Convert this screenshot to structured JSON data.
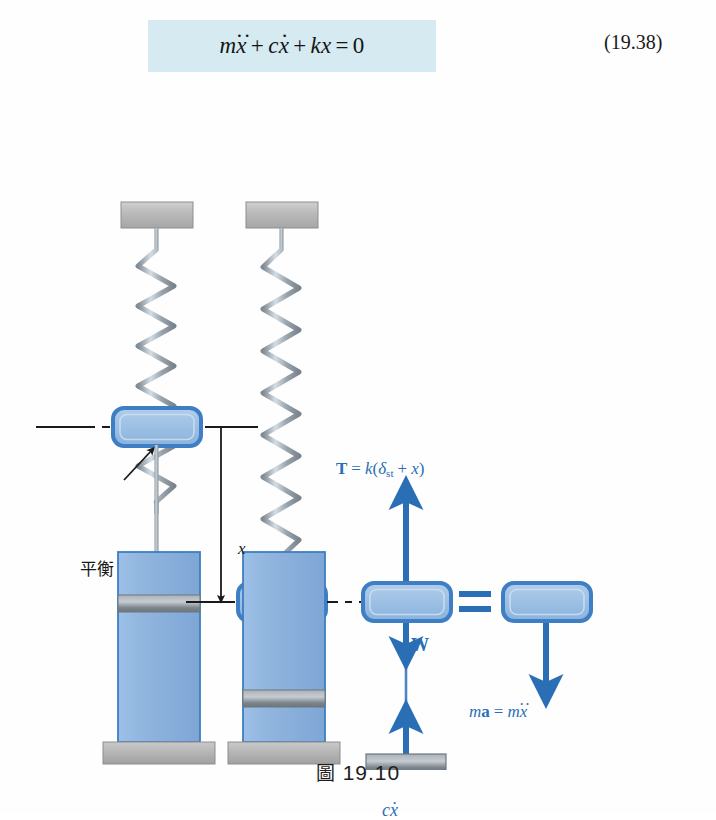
{
  "equation": {
    "id": "eq-19-38",
    "number": "(19.38)",
    "terms": {
      "mass_term": "m",
      "mass_accent": "··",
      "mass_var": "x",
      "plus_1": "+",
      "damping_term": "c",
      "damping_accent": "·",
      "damping_var": "x",
      "plus_2": "+",
      "stiffness_term": "k",
      "stiffness_var": "x",
      "equals": "=",
      "rhs": "0"
    },
    "plain_text": "mẍ̈ + cẋ + kx = 0",
    "highlight_color": "#d6eaf2"
  },
  "figure": {
    "caption_symbol": "圖",
    "caption_number": "19.10",
    "labels": {
      "equilibrium": "平衡",
      "displacement": "x",
      "tension": {
        "vector": "T",
        "equals": "=",
        "stiffness": "k",
        "open": "(",
        "delta": "δ",
        "delta_sub": "st",
        "plus": "+",
        "disp": "x",
        "close": ")",
        "plain_text": "T = k(δst + x)"
      },
      "weight": "W",
      "damping_force": {
        "coefficient": "c",
        "accent": "·",
        "variable": "x",
        "plain_text": "cẋ"
      },
      "inertia": {
        "mass": "m",
        "accel_vector": "a",
        "equals": "=",
        "mass_2": "m",
        "accent": "··",
        "variable": "x",
        "plain_text": "ma = mẍ̈"
      },
      "equals_sign": "="
    },
    "colors": {
      "collar_fill": "#9cc0e4",
      "collar_stroke": "#3d7ec4",
      "cylinder_fill": "#8fb4dd",
      "cylinder_stroke": "#3d7ec4",
      "arrow_blue": "#2a6fb5",
      "spring_gray": "#9aa4ad",
      "support_gray": "#b4b4b4",
      "piston_gray": "#8e949a",
      "line_black": "#1a1a1a"
    },
    "parts": [
      {
        "name": "ceiling-support-left",
        "kind": "support"
      },
      {
        "name": "ceiling-support-right",
        "kind": "support"
      },
      {
        "name": "spring-left",
        "kind": "spring"
      },
      {
        "name": "spring-right",
        "kind": "spring"
      },
      {
        "name": "collar-left",
        "kind": "mass-collar"
      },
      {
        "name": "collar-right",
        "kind": "mass-collar"
      },
      {
        "name": "collar-fbd",
        "kind": "mass-collar"
      },
      {
        "name": "collar-kinetic",
        "kind": "mass-collar"
      },
      {
        "name": "damper-cylinder-left",
        "kind": "damper"
      },
      {
        "name": "damper-cylinder-right",
        "kind": "damper"
      },
      {
        "name": "damper-piston-fbd",
        "kind": "piston"
      },
      {
        "name": "ground-base-left",
        "kind": "ground"
      },
      {
        "name": "ground-base-right",
        "kind": "ground"
      }
    ]
  }
}
